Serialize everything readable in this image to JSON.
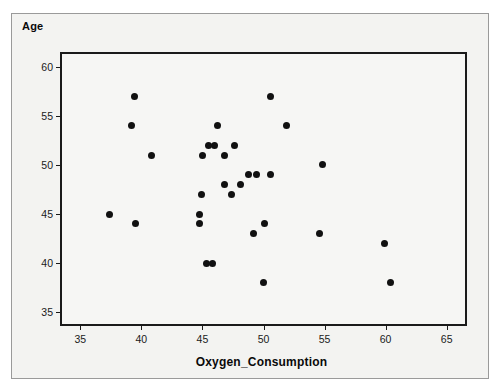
{
  "chart_data": {
    "type": "scatter",
    "title": "",
    "xlabel": "Oxygen_Consumption",
    "ylabel": "Age",
    "xlim": [
      33.5,
      66.5
    ],
    "ylim": [
      33.8,
      61.3
    ],
    "xticks": [
      35,
      40,
      45,
      50,
      55,
      60,
      65
    ],
    "yticks": [
      35,
      40,
      45,
      50,
      55,
      60
    ],
    "grid": false,
    "legend": null,
    "marker": {
      "shape": "circle",
      "color": "#111111",
      "size": 7
    },
    "plot_background": "#f6f6f4",
    "frame_color": "#1a1a1a",
    "points": [
      {
        "x": 39.4,
        "y": 57
      },
      {
        "x": 50.6,
        "y": 57
      },
      {
        "x": 39.2,
        "y": 54
      },
      {
        "x": 46.2,
        "y": 54
      },
      {
        "x": 51.9,
        "y": 54
      },
      {
        "x": 45.5,
        "y": 52
      },
      {
        "x": 46.0,
        "y": 52
      },
      {
        "x": 47.6,
        "y": 52
      },
      {
        "x": 40.8,
        "y": 51
      },
      {
        "x": 45.0,
        "y": 51
      },
      {
        "x": 46.8,
        "y": 51
      },
      {
        "x": 54.8,
        "y": 50
      },
      {
        "x": 48.8,
        "y": 49
      },
      {
        "x": 49.4,
        "y": 49
      },
      {
        "x": 50.6,
        "y": 49
      },
      {
        "x": 46.8,
        "y": 48
      },
      {
        "x": 48.1,
        "y": 48
      },
      {
        "x": 44.9,
        "y": 47
      },
      {
        "x": 47.4,
        "y": 47
      },
      {
        "x": 37.4,
        "y": 45
      },
      {
        "x": 44.8,
        "y": 45
      },
      {
        "x": 39.5,
        "y": 44
      },
      {
        "x": 44.8,
        "y": 44
      },
      {
        "x": 50.1,
        "y": 44
      },
      {
        "x": 49.2,
        "y": 43
      },
      {
        "x": 54.6,
        "y": 43
      },
      {
        "x": 59.9,
        "y": 42
      },
      {
        "x": 45.3,
        "y": 40
      },
      {
        "x": 45.8,
        "y": 40
      },
      {
        "x": 50.0,
        "y": 38
      },
      {
        "x": 60.4,
        "y": 38
      }
    ]
  }
}
